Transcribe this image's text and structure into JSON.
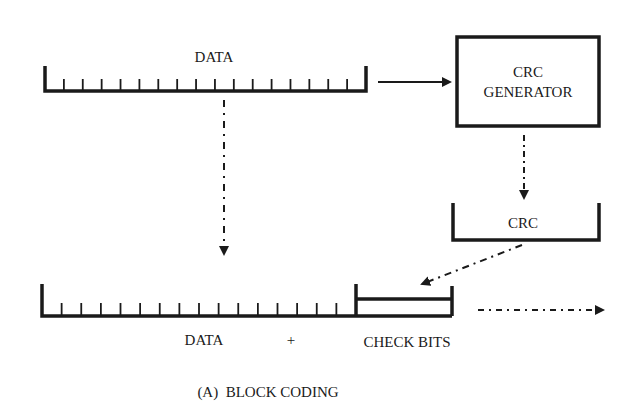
{
  "diagram": {
    "caption": "(A)  BLOCK CODING",
    "colors": {
      "ink": "#1a1a1a",
      "background": "#ffffff"
    },
    "top_register": {
      "label": "DATA",
      "tick_count": 16
    },
    "generator": {
      "line1": "CRC",
      "line2": "GENERATOR"
    },
    "crc_register": {
      "label": "CRC"
    },
    "bottom_register": {
      "data_label": "DATA",
      "plus": "+",
      "check_label": "CHECK BITS",
      "tick_count": 15
    },
    "arrows": [
      {
        "from": "top-data-register",
        "to": "crc-generator",
        "style": "solid"
      },
      {
        "from": "crc-generator",
        "to": "crc-register",
        "style": "dotted"
      },
      {
        "from": "top-data-register",
        "to": "bottom-register",
        "style": "dash-dot"
      },
      {
        "from": "crc-register",
        "to": "check-bits",
        "style": "dashed"
      },
      {
        "from": "bottom-register",
        "to": "output",
        "style": "dash-dot"
      }
    ]
  }
}
